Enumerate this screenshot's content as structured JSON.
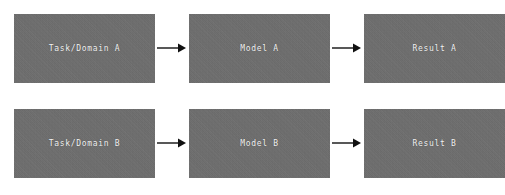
{
  "diagram": {
    "type": "flowchart",
    "title": "",
    "background_color": "#ffffff",
    "box_color": "#6e6e6e",
    "label_color": "#f2f2f2",
    "arrow_color": "#111111",
    "rows": [
      {
        "id": "row-a",
        "nodes": [
          {
            "label": "Task/Domain A",
            "name": "task-domain-a"
          },
          {
            "label": "Model A",
            "name": "model-a"
          },
          {
            "label": "Result A",
            "name": "result-a"
          }
        ],
        "arrows": [
          {
            "name": "arrow-task-a-to-model-a",
            "glyph": "right-arrow-icon"
          },
          {
            "name": "arrow-model-a-to-result-a",
            "glyph": "right-arrow-icon"
          }
        ]
      },
      {
        "id": "row-b",
        "nodes": [
          {
            "label": "Task/Domain B",
            "name": "task-domain-b"
          },
          {
            "label": "Model B",
            "name": "model-b"
          },
          {
            "label": "Result B",
            "name": "result-b"
          }
        ],
        "arrows": [
          {
            "name": "arrow-task-b-to-model-b",
            "glyph": "right-arrow-icon"
          },
          {
            "name": "arrow-model-b-to-result-b",
            "glyph": "right-arrow-icon"
          }
        ]
      }
    ]
  }
}
